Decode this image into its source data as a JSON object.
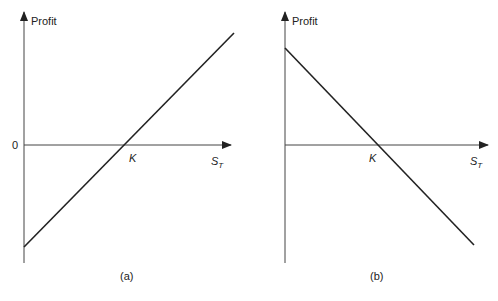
{
  "panels": [
    {
      "id": "a",
      "caption": "(a)",
      "y_axis_label": "Profit",
      "origin_label": "0",
      "strike_label": "K",
      "x_axis_label_main": "S",
      "x_axis_label_sub": "T",
      "slope": "positive"
    },
    {
      "id": "b",
      "caption": "(b)",
      "y_axis_label": "Profit",
      "strike_label": "K",
      "x_axis_label_main": "S",
      "x_axis_label_sub": "T",
      "slope": "negative"
    }
  ],
  "colors": {
    "line": "#222222",
    "axis": "#333333",
    "background": "#ffffff"
  }
}
